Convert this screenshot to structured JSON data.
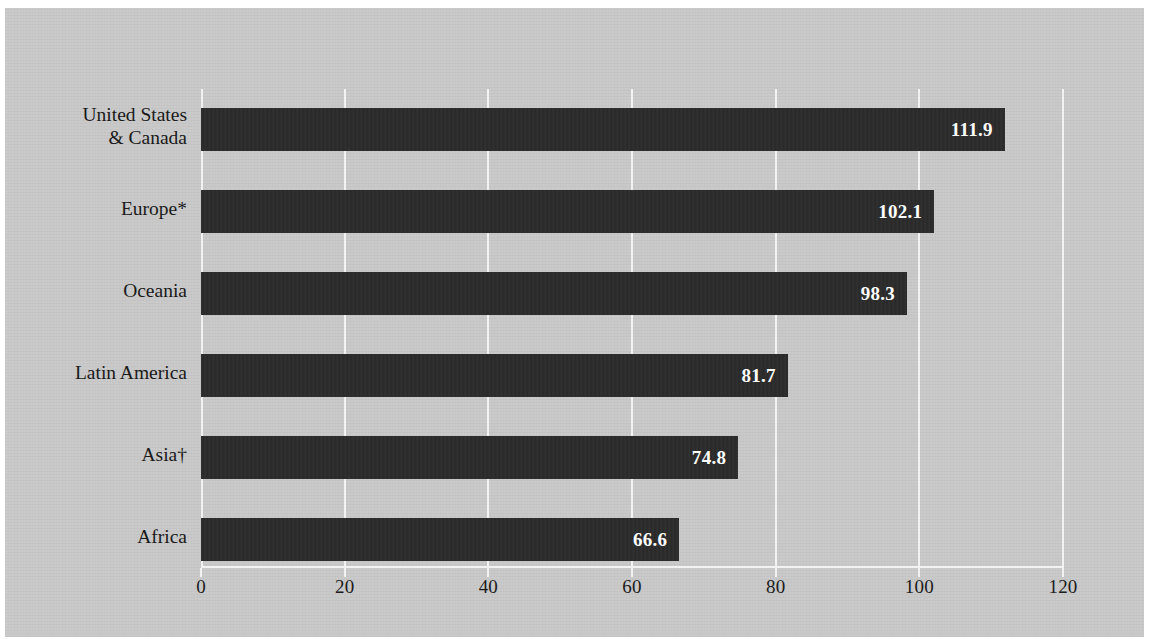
{
  "chart_data": {
    "type": "bar",
    "orientation": "horizontal",
    "title": "",
    "subtitle": "",
    "xlabel": "",
    "ylabel": "",
    "categories": [
      "United States\n& Canada",
      "Europe*",
      "Oceania",
      "Latin America",
      "Asia†",
      "Africa"
    ],
    "values": [
      111.9,
      102.1,
      98.3,
      81.7,
      74.8,
      66.6
    ],
    "value_labels": [
      "111.9",
      "102.1",
      "98.3",
      "81.7",
      "74.8",
      "66.6"
    ],
    "xlim": [
      0,
      120
    ],
    "xticks": [
      0,
      20,
      40,
      60,
      80,
      100,
      120
    ],
    "xtick_labels": [
      "0",
      "20",
      "40",
      "60",
      "80",
      "100",
      "120"
    ],
    "grid": true,
    "grid_axis": "x",
    "legend": null,
    "legend_position": "none",
    "annotations": [
      "*",
      "†"
    ]
  },
  "style": {
    "background_color": "#c9c9c9",
    "page_color": "#ffffff",
    "bar_color": "#2b2b2b",
    "grid_color": "#f2f2f2",
    "axis_color": "#f2f2f2",
    "text_color": "#1a1a1a",
    "value_label_color": "#ffffff"
  }
}
